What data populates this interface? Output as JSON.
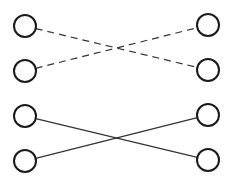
{
  "diagram": {
    "background": "#ffffff",
    "node_stroke": "#1a1a1a",
    "line_color": "#333333",
    "node_radius": 11,
    "nodes": [
      {
        "id": "L1",
        "x": 25,
        "y": 26
      },
      {
        "id": "L2",
        "x": 25,
        "y": 71
      },
      {
        "id": "L3",
        "x": 25,
        "y": 116
      },
      {
        "id": "L4",
        "x": 25,
        "y": 161
      },
      {
        "id": "R1",
        "x": 208,
        "y": 25
      },
      {
        "id": "R2",
        "x": 208,
        "y": 70
      },
      {
        "id": "R3",
        "x": 208,
        "y": 115
      },
      {
        "id": "R4",
        "x": 208,
        "y": 160
      }
    ],
    "edges": [
      {
        "from": "L1",
        "to": "R2",
        "style": "dashed"
      },
      {
        "from": "L2",
        "to": "R1",
        "style": "dashed"
      },
      {
        "from": "L3",
        "to": "R4",
        "style": "solid"
      },
      {
        "from": "L4",
        "to": "R3",
        "style": "solid"
      }
    ]
  }
}
